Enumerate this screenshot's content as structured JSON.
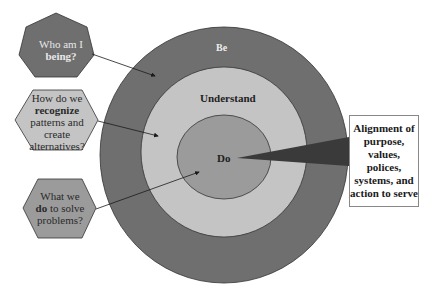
{
  "diagram": {
    "rings": [
      {
        "id": "be",
        "label": "Be",
        "color": "#6f6f6f"
      },
      {
        "id": "understand",
        "label": "Understand",
        "color": "#c4c4c4"
      },
      {
        "id": "do",
        "label": "Do",
        "color": "#9b9b9b"
      }
    ],
    "questions": [
      {
        "id": "being",
        "line1": "Who am I",
        "bold": "being?",
        "shape": "heptagon",
        "color": "#6f6f6f",
        "target": "be"
      },
      {
        "id": "recognize",
        "line1": "How do we",
        "bold": "recognize",
        "rest": "patterns and create alternatives?",
        "shape": "hexagon",
        "color": "#c4c4c4",
        "target": "understand"
      },
      {
        "id": "do",
        "line1": "What we",
        "bold": "do",
        "rest": "to solve problems?",
        "shape": "hexagon",
        "color": "#9b9b9b",
        "target": "do"
      }
    ],
    "alignment_box": {
      "text": "Alignment of purpose, values, polices, systems, and action to serve"
    },
    "wedge_color": "#3a3a3a"
  }
}
